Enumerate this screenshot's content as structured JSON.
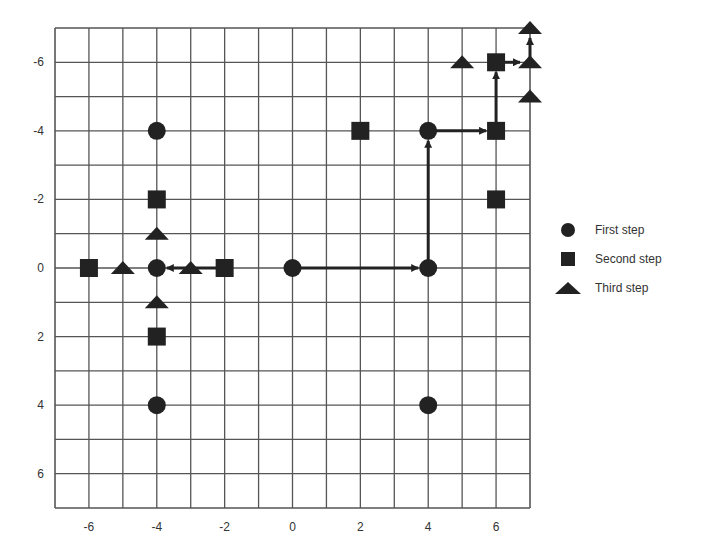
{
  "chart_data": {
    "type": "scatter",
    "title": "",
    "xlabel": "",
    "ylabel": "",
    "xlim": [
      -7,
      7
    ],
    "ylim": [
      -7,
      7
    ],
    "y_inverted": true,
    "grid": true,
    "x_ticks": [
      -6,
      -4,
      -2,
      0,
      2,
      4,
      6
    ],
    "y_ticks": [
      -6,
      -4,
      -2,
      0,
      2,
      4,
      6
    ],
    "x_tick_labels": [
      "-6",
      "-4",
      "-2",
      "0",
      "2",
      "4",
      "6"
    ],
    "y_tick_labels": [
      "-6",
      "-4",
      "-2",
      "0",
      "2",
      "4",
      "6"
    ],
    "legend_position": "right",
    "series": [
      {
        "name": "First step",
        "marker": "circle",
        "points": [
          [
            -4,
            -4
          ],
          [
            -4,
            0
          ],
          [
            0,
            0
          ],
          [
            4,
            0
          ],
          [
            4,
            -4
          ],
          [
            -4,
            4
          ],
          [
            4,
            4
          ]
        ]
      },
      {
        "name": "Second step",
        "marker": "square",
        "points": [
          [
            -6,
            0
          ],
          [
            -2,
            0
          ],
          [
            -4,
            -2
          ],
          [
            -4,
            2
          ],
          [
            2,
            -4
          ],
          [
            6,
            -4
          ],
          [
            6,
            -6
          ],
          [
            6,
            -2
          ]
        ]
      },
      {
        "name": "Third step",
        "marker": "triangle",
        "points": [
          [
            -5,
            0
          ],
          [
            -3,
            0
          ],
          [
            -4,
            -1
          ],
          [
            -4,
            1
          ],
          [
            5,
            -6
          ],
          [
            7,
            -6
          ],
          [
            7,
            -7
          ],
          [
            7,
            -5
          ]
        ]
      }
    ],
    "arrows": [
      {
        "from": [
          0,
          0
        ],
        "to": [
          4,
          0
        ]
      },
      {
        "from": [
          4,
          0
        ],
        "to": [
          4,
          -4
        ]
      },
      {
        "from": [
          4,
          -4
        ],
        "to": [
          6,
          -4
        ]
      },
      {
        "from": [
          6,
          -4
        ],
        "to": [
          6,
          -6
        ]
      },
      {
        "from": [
          6,
          -6
        ],
        "to": [
          7,
          -6
        ]
      },
      {
        "from": [
          7,
          -6
        ],
        "to": [
          7,
          -7
        ]
      },
      {
        "from": [
          -2,
          0
        ],
        "to": [
          -4,
          0
        ]
      }
    ],
    "colors": {
      "marker": "#222222",
      "grid": "#555555",
      "axis_text": "#333333"
    }
  },
  "legend": {
    "items": [
      {
        "label": "First step",
        "marker": "circle"
      },
      {
        "label": "Second step",
        "marker": "square"
      },
      {
        "label": "Third step",
        "marker": "triangle"
      }
    ]
  }
}
